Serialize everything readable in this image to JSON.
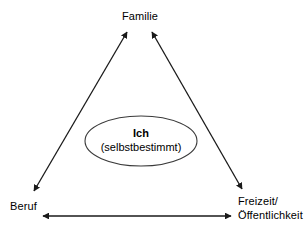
{
  "diagram": {
    "background_color": "#ffffff",
    "line_color": "#1a1a1a",
    "text_color": "#000000",
    "nodes": {
      "top": {
        "label": "Familie"
      },
      "bottom_left": {
        "label": "Beruf"
      },
      "bottom_right": {
        "line1": "Freizeit/",
        "line2": "Öffentlichkeit"
      },
      "center": {
        "title": "Ich",
        "subtitle": "(selbstbestimmt)"
      }
    },
    "connectors": [
      {
        "name": "beruf-to-familie",
        "arrowheads": "both"
      },
      {
        "name": "freizeit-to-familie",
        "arrowheads": "both"
      },
      {
        "name": "beruf-to-freizeit",
        "arrowheads": "both"
      }
    ]
  }
}
